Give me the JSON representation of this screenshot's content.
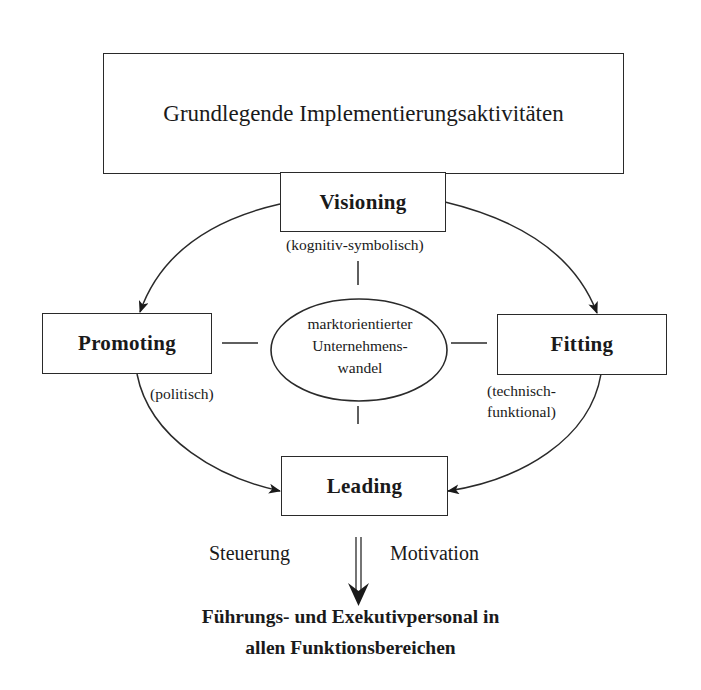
{
  "title": "Grundlegende Implementierungsaktivitäten",
  "nodes": {
    "visioning": {
      "label": "Visioning",
      "note": "(kognitiv-symbolisch)"
    },
    "promoting": {
      "label": "Promoting",
      "note": "(politisch)"
    },
    "fitting": {
      "label": "Fitting",
      "note_line1": "(technisch-",
      "note_line2": "funktional)"
    },
    "leading": {
      "label": "Leading"
    }
  },
  "center": {
    "line1": "marktorientierter",
    "line2": "Unternehmens-",
    "line3": "wandel"
  },
  "flow": {
    "left_label": "Steuerung",
    "right_label": "Motivation"
  },
  "target": {
    "line1": "Führungs- und Exekutivpersonal in",
    "line2": "allen Funktionsbereichen"
  },
  "edges": [
    {
      "from": "Visioning",
      "to": "Promoting",
      "type": "curved-arrow"
    },
    {
      "from": "Visioning",
      "to": "Fitting",
      "type": "curved-arrow"
    },
    {
      "from": "Promoting",
      "to": "Leading",
      "type": "curved-arrow"
    },
    {
      "from": "Fitting",
      "to": "Leading",
      "type": "curved-arrow"
    },
    {
      "from": "Leading",
      "to": "Führungs- und Exekutivpersonal",
      "type": "double-arrow"
    }
  ]
}
